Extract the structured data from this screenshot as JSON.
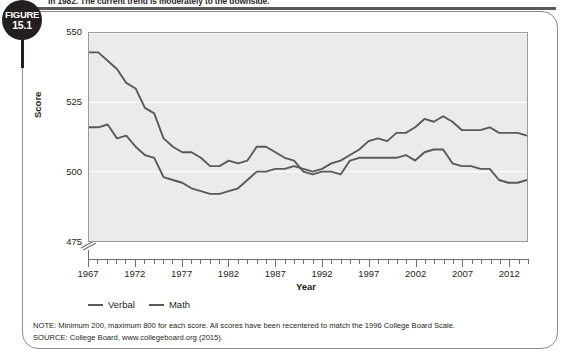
{
  "figure": {
    "badge_line1": "FIGURE",
    "badge_line2": "15.1",
    "caption_fragment": "in 1982. The current trend is moderately to the downside."
  },
  "legend": {
    "items": [
      {
        "label": "Verbal",
        "color": "#58595b"
      },
      {
        "label": "Math",
        "color": "#58595b"
      }
    ]
  },
  "notes": {
    "note": "NOTE: Minimum 200, maximum 800 for each score. All scores have been recentered to match the 1996 College Board Scale.",
    "source": "SOURCE: College Board, www.collegeboard.org (2015)."
  },
  "chart_data": {
    "type": "line",
    "title": "",
    "xlabel": "Year",
    "ylabel": "Score",
    "xlim": [
      1967,
      2014
    ],
    "ylim": [
      475,
      550
    ],
    "yticks": [
      475,
      500,
      525,
      550
    ],
    "xticks_major": [
      1967,
      1972,
      1977,
      1982,
      1987,
      1992,
      1997,
      2002,
      2007,
      2012
    ],
    "axis_break_below": 475,
    "grid": "horizontal-white",
    "legend_position": "below-left",
    "plot_background": "#ebebeb",
    "line_color": "#58595b",
    "x": [
      1967,
      1968,
      1969,
      1970,
      1971,
      1972,
      1973,
      1974,
      1975,
      1976,
      1977,
      1978,
      1979,
      1980,
      1981,
      1982,
      1983,
      1984,
      1985,
      1986,
      1987,
      1988,
      1989,
      1990,
      1991,
      1992,
      1993,
      1994,
      1995,
      1996,
      1997,
      1998,
      1999,
      2000,
      2001,
      2002,
      2003,
      2004,
      2005,
      2006,
      2007,
      2008,
      2009,
      2010,
      2011,
      2012,
      2013,
      2014
    ],
    "series": [
      {
        "name": "Verbal",
        "values": [
          543,
          543,
          540,
          537,
          532,
          530,
          523,
          521,
          512,
          509,
          507,
          507,
          505,
          502,
          502,
          504,
          503,
          504,
          509,
          509,
          507,
          505,
          504,
          500,
          499,
          500,
          500,
          499,
          504,
          505,
          505,
          505,
          505,
          505,
          506,
          504,
          507,
          508,
          508,
          503,
          502,
          502,
          501,
          501,
          497,
          496,
          496,
          497
        ]
      },
      {
        "name": "Math",
        "values": [
          516,
          516,
          517,
          512,
          513,
          509,
          506,
          505,
          498,
          497,
          496,
          494,
          493,
          492,
          492,
          493,
          494,
          497,
          500,
          500,
          501,
          501,
          502,
          501,
          500,
          501,
          503,
          504,
          506,
          508,
          511,
          512,
          511,
          514,
          514,
          516,
          519,
          518,
          520,
          518,
          515,
          515,
          515,
          516,
          514,
          514,
          514,
          513
        ]
      }
    ]
  }
}
